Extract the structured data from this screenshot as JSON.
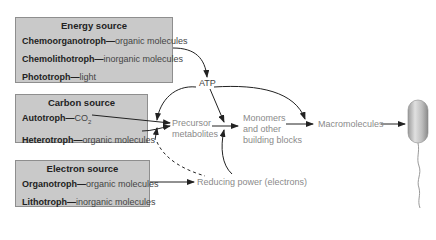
{
  "energy_box": {
    "title": "Energy source",
    "items": [
      {
        "term": "Chemoorganotroph",
        "sep": "—",
        "desc": "organic molecules"
      },
      {
        "term": "Chemolithotroph",
        "sep": "—",
        "desc": "inorganic molecules"
      },
      {
        "term": "Phototroph",
        "sep": "—",
        "desc": "light"
      }
    ]
  },
  "carbon_box": {
    "title": "Carbon source",
    "items": [
      {
        "term": "Autotroph",
        "sep": "—",
        "desc": "CO",
        "sub": "2"
      },
      {
        "term": "Heterotroph",
        "sep": "—",
        "desc": "organic molecules"
      }
    ]
  },
  "electron_box": {
    "title": "Electron source",
    "items": [
      {
        "term": "Organotroph",
        "sep": "—",
        "desc": "organic molecules"
      },
      {
        "term": "Lithotroph",
        "sep": "—",
        "desc": "inorganic molecules"
      }
    ]
  },
  "nodes": {
    "atp": "ATP",
    "precursor_1": "Precursor",
    "precursor_2": "metabolites",
    "monomers_1": "Monomers",
    "monomers_2": "and other",
    "monomers_3": "building blocks",
    "macromolecules": "Macromolecules",
    "reducing_power": "Reducing power (electrons)"
  },
  "colors": {
    "box_fill": "#c9c9c9",
    "box_border": "#8e8e8e",
    "arrow": "#222222",
    "node_text": "#8a8a8a"
  }
}
